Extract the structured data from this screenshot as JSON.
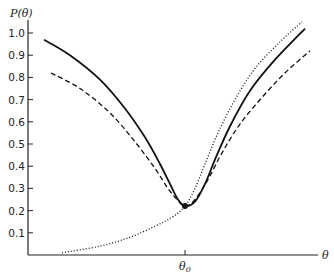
{
  "chart_data": {
    "type": "line",
    "title": "",
    "ylabel": "P(θ)",
    "xlabel": "θ",
    "ylim": [
      0,
      1.05
    ],
    "yticks": [
      0.1,
      0.2,
      0.3,
      0.4,
      0.5,
      0.6,
      0.7,
      0.8,
      0.9,
      1.0
    ],
    "ytick_labels": [
      "0.1",
      "0.2",
      "0.3",
      "0.4",
      "0.5",
      "0.6",
      "0.7",
      "0.8",
      "0.9",
      "1.0"
    ],
    "xticks": [
      {
        "x": 185,
        "label": "θ0"
      }
    ],
    "grid": false,
    "legend": null,
    "annotations": [
      {
        "type": "point",
        "x": 185,
        "y": 0.22,
        "label": "minimum at θ0"
      }
    ],
    "series": [
      {
        "name": "solid",
        "style": "solid",
        "points": [
          [
            44,
            0.97
          ],
          [
            70,
            0.9
          ],
          [
            100,
            0.79
          ],
          [
            125,
            0.66
          ],
          [
            145,
            0.53
          ],
          [
            160,
            0.41
          ],
          [
            170,
            0.32
          ],
          [
            178,
            0.25
          ],
          [
            185,
            0.22
          ],
          [
            195,
            0.24
          ],
          [
            205,
            0.32
          ],
          [
            215,
            0.43
          ],
          [
            230,
            0.58
          ],
          [
            250,
            0.74
          ],
          [
            275,
            0.88
          ],
          [
            305,
            1.02
          ]
        ]
      },
      {
        "name": "dashed",
        "style": "dashed",
        "points": [
          [
            51,
            0.82
          ],
          [
            80,
            0.75
          ],
          [
            110,
            0.64
          ],
          [
            135,
            0.51
          ],
          [
            155,
            0.39
          ],
          [
            168,
            0.3
          ],
          [
            177,
            0.25
          ],
          [
            185,
            0.22
          ],
          [
            195,
            0.25
          ],
          [
            208,
            0.34
          ],
          [
            222,
            0.46
          ],
          [
            240,
            0.59
          ],
          [
            262,
            0.71
          ],
          [
            285,
            0.82
          ],
          [
            310,
            0.92
          ]
        ]
      },
      {
        "name": "dotted",
        "style": "dotted",
        "points": [
          [
            62,
            0.01
          ],
          [
            100,
            0.04
          ],
          [
            130,
            0.08
          ],
          [
            155,
            0.13
          ],
          [
            172,
            0.17
          ],
          [
            185,
            0.22
          ],
          [
            195,
            0.3
          ],
          [
            205,
            0.41
          ],
          [
            218,
            0.55
          ],
          [
            235,
            0.7
          ],
          [
            255,
            0.84
          ],
          [
            280,
            0.96
          ],
          [
            302,
            1.05
          ]
        ]
      }
    ]
  },
  "axes": {
    "y_title": "P(θ)",
    "x_title": "θ",
    "x_tick_label_main": "θ",
    "x_tick_label_sub": "0"
  }
}
